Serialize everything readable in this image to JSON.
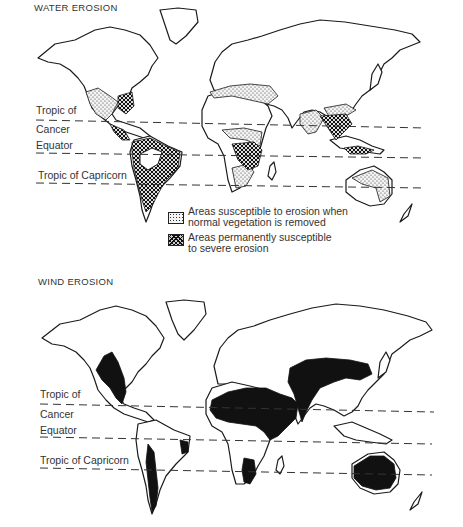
{
  "figures": [
    {
      "id": "water",
      "title": "WATER EROSION",
      "latitude_labels": {
        "tropic_cancer_line1": "Tropic of",
        "tropic_cancer_line2": "Cancer",
        "equator": "Equator",
        "tropic_capricorn": "Tropic of Capricorn"
      },
      "legend": [
        {
          "pattern": "dotted",
          "text_line1": "Areas susceptible to erosion when",
          "text_line2": "normal vegetation is removed"
        },
        {
          "pattern": "crosshatch",
          "text_line1": "Areas permanently susceptible",
          "text_line2": "to severe erosion"
        }
      ]
    },
    {
      "id": "wind",
      "title": "WIND EROSION",
      "latitude_labels": {
        "tropic_cancer_line1": "Tropic of",
        "tropic_cancer_line2": "Cancer",
        "equator": "Equator",
        "tropic_capricorn": "Tropic of Capricorn"
      },
      "legend_fill": "solid black = areas susceptible to wind erosion"
    }
  ],
  "colors": {
    "outline": "#1a1a1a",
    "background": "#ffffff",
    "text": "#333333",
    "solid_fill": "#111111"
  }
}
